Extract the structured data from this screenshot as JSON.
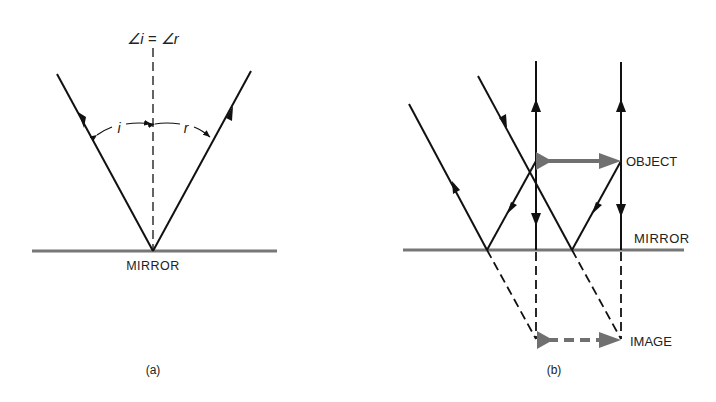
{
  "panel_a": {
    "caption": "(a)",
    "equation": "∠i = ∠r",
    "angle_i_label": "i",
    "angle_r_label": "r",
    "mirror_label": "MIRROR"
  },
  "panel_b": {
    "caption": "(b)",
    "object_label": "OBJECT",
    "image_label": "IMAGE",
    "mirror_label": "MIRROR"
  },
  "colors": {
    "ray": "#111111",
    "mirror": "#777777",
    "object_arrow": "#707070"
  }
}
